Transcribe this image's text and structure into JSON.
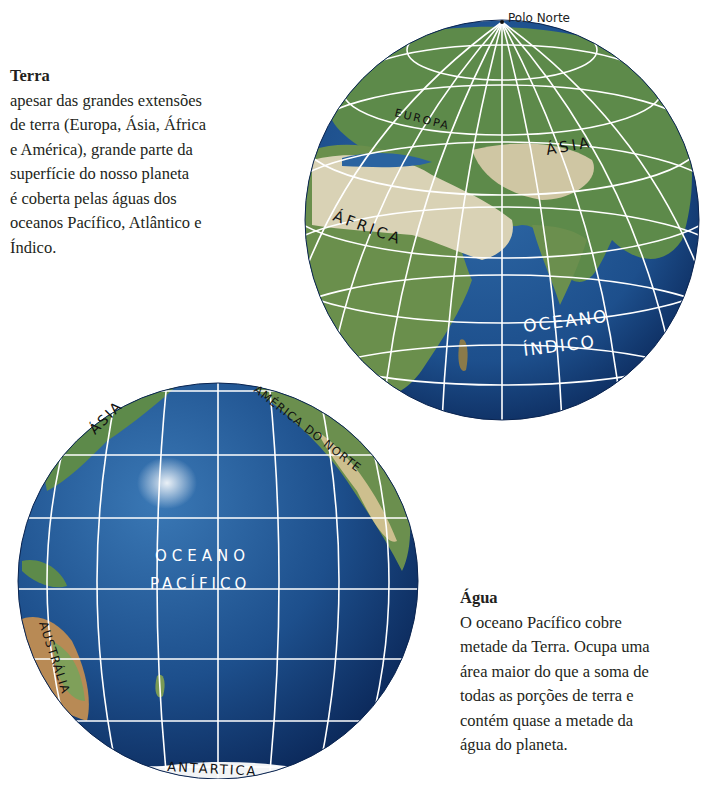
{
  "terra": {
    "title": "Terra",
    "lines": [
      "apesar das grandes extensões",
      "de terra (Europa, Ásia, África",
      "e América), grande parte da",
      "superfície do nosso planeta",
      "é coberta pelas águas dos",
      "oceanos Pacífico, Atlântico e",
      "Índico."
    ]
  },
  "agua": {
    "title": "Água",
    "lines": [
      "O oceano Pacífico cobre",
      "metade da Terra. Ocupa uma",
      "área maior do que a soma de",
      "todas as porções de terra e",
      "contém quase a metade da",
      "água do planeta."
    ]
  },
  "globe_eastern": {
    "pole_label": "Polo Norte",
    "labels": {
      "europa": "EUROPA",
      "asia": "ÁSIA",
      "africa": "ÁFRICA",
      "ocean_line1": "OCEANO",
      "ocean_line2": "ÍNDICO"
    }
  },
  "globe_pacific": {
    "labels": {
      "asia": "ÁSIA",
      "north_america": "AMÉRICA DO NORTE",
      "ocean_line1": "OCEANO",
      "ocean_line2": "PACÍFICO",
      "australia": "AUSTRÁLIA",
      "antarctica": "ANTÁRTICA"
    }
  },
  "colors": {
    "ocean": "#1d4f8c",
    "ocean_dark": "#0f2f63",
    "land_green": "#5d8a4a",
    "desert": "#d9d2b5",
    "grid": "#ffffff",
    "text": "#231f20"
  }
}
